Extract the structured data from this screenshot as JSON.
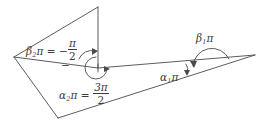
{
  "figure": {
    "background_color": "#ffffff",
    "stroke_color": "#4a4a4a",
    "text_color": "#3c3c3c",
    "width": 262,
    "height": 124,
    "labels": {
      "beta2": {
        "symbol": "β",
        "subscript": "2",
        "pi": "π",
        "equals": "=",
        "sign": "−",
        "value_numerator": "π",
        "value_denominator": "2",
        "full_text": "β₂π = −π/2"
      },
      "alpha2": {
        "symbol": "α",
        "subscript": "2",
        "pi": "π",
        "equals": "=",
        "value_numerator": "3π",
        "value_denominator": "2",
        "full_text": "α₂π = 3π/2"
      },
      "alpha1": {
        "symbol": "α",
        "subscript": "1",
        "pi": "π",
        "full_text": "α₁π"
      },
      "beta1": {
        "symbol": "β",
        "subscript": "1",
        "pi": "π",
        "full_text": "β₁π"
      },
      "stray_minus": {
        "text": "−"
      }
    },
    "geometry": {
      "polygon_points": "98,7 14,57 58,118 255,55",
      "vertical_edge": "98,7 98,68",
      "inner_edge_left": "98,68 14,57",
      "inner_edge_right": "98,68 255,55",
      "vertex_center": [
        98,
        68
      ],
      "vertex_right": [
        255,
        55
      ],
      "apex_top": [
        98,
        7
      ],
      "vertex_left": [
        14,
        57
      ],
      "vertex_bottom": [
        58,
        118
      ]
    },
    "arcs": {
      "alpha2_reflex_arc": "reflex angle arc of 3π/2 around the central vertex",
      "beta2_small_arc": "small arc indicating the exterior angle −π/2",
      "alpha1_arc": "small arc at the right interior angle α₁π",
      "beta1_arc": "large arc above the right vertex for exterior angle β₁π"
    }
  }
}
